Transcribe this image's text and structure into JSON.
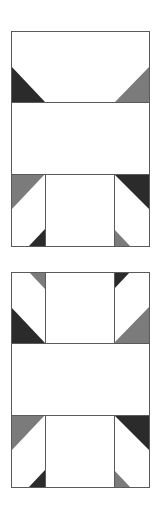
{
  "figure": {
    "colors": {
      "dark": "#2b2b2b",
      "medium": "#7b7b7b",
      "background": "#ffffff",
      "outline": "#5a5a5a"
    },
    "blocks": [
      {
        "name": "block-top",
        "outer": {
          "x": 11,
          "y": 31,
          "w": 138,
          "h": 215
        },
        "lines": [
          {
            "x1": 11,
            "y1": 102,
            "x2": 149,
            "y2": 102
          },
          {
            "x1": 11,
            "y1": 174,
            "x2": 149,
            "y2": 174
          },
          {
            "x1": 45,
            "y1": 174,
            "x2": 45,
            "y2": 246
          },
          {
            "x1": 114,
            "y1": 174,
            "x2": 114,
            "y2": 246
          }
        ],
        "triangles": [
          {
            "name": "top-left-dark-triangle",
            "tone": "dark",
            "points": "11,66 11,102 45,102"
          },
          {
            "name": "top-right-gray-triangle",
            "tone": "medium",
            "points": "149,67 149,102 115,102"
          },
          {
            "name": "lower-left-gray-triangle",
            "tone": "medium",
            "points": "11,174 45,174 11,210"
          },
          {
            "name": "lower-right-dark-triangle",
            "tone": "dark",
            "points": "114,174 149,174 149,209"
          },
          {
            "name": "bottom-left-small-dark-triangle",
            "tone": "dark",
            "points": "45,229 45,246 29,246"
          },
          {
            "name": "bottom-right-small-gray-triangle",
            "tone": "medium",
            "points": "114,229 114,246 130,246"
          }
        ]
      },
      {
        "name": "block-bottom",
        "outer": {
          "x": 11,
          "y": 272,
          "w": 138,
          "h": 215
        },
        "lines": [
          {
            "x1": 45,
            "y1": 272,
            "x2": 45,
            "y2": 343
          },
          {
            "x1": 114,
            "y1": 272,
            "x2": 114,
            "y2": 343
          },
          {
            "x1": 11,
            "y1": 343,
            "x2": 149,
            "y2": 343
          },
          {
            "x1": 11,
            "y1": 415,
            "x2": 149,
            "y2": 415
          },
          {
            "x1": 45,
            "y1": 415,
            "x2": 45,
            "y2": 487
          },
          {
            "x1": 114,
            "y1": 415,
            "x2": 114,
            "y2": 487
          }
        ],
        "triangles": [
          {
            "name": "top-left-small-gray-triangle",
            "tone": "medium",
            "points": "29,272 45,272 45,289"
          },
          {
            "name": "top-right-small-dark-triangle",
            "tone": "dark",
            "points": "114,272 130,272 114,289"
          },
          {
            "name": "upper-left-dark-triangle",
            "tone": "dark",
            "points": "11,307 11,343 45,343"
          },
          {
            "name": "upper-right-gray-triangle",
            "tone": "medium",
            "points": "149,307 149,343 114,343"
          },
          {
            "name": "lower-left-gray-triangle",
            "tone": "medium",
            "points": "11,415 45,415 11,451"
          },
          {
            "name": "lower-right-dark-triangle",
            "tone": "dark",
            "points": "114,415 149,415 149,450"
          },
          {
            "name": "bottom-left-small-dark-triangle",
            "tone": "dark",
            "points": "45,470 45,487 29,487"
          },
          {
            "name": "bottom-right-small-gray-triangle",
            "tone": "medium",
            "points": "114,470 114,487 130,487"
          }
        ]
      }
    ]
  }
}
